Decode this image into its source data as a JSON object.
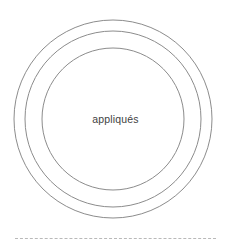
{
  "figure": {
    "background_color": "#ffffff",
    "width": 231,
    "height": 251,
    "center_label": "appliqués",
    "label_color": "#3f3f3f",
    "ring_color": "#8c8c8c",
    "divider_color": "#b9b9b9",
    "divider_style": "dashed"
  },
  "chart_data": {
    "type": "diagram",
    "title": "appliqués",
    "shape": "concentric-circles",
    "center": {
      "x": 113,
      "y": 119
    },
    "rings": [
      {
        "name": "outer-ring",
        "radius": 99,
        "stroke": "#8c8c8c",
        "stroke_width": 1,
        "fill": "none"
      },
      {
        "name": "middle-ring",
        "radius": 88,
        "stroke": "#8c8c8c",
        "stroke_width": 1,
        "fill": "none"
      },
      {
        "name": "inner-ring",
        "radius": 71,
        "stroke": "#8c8c8c",
        "stroke_width": 1,
        "fill": "none"
      }
    ],
    "annotations": [
      {
        "text": "appliqués",
        "x": 115,
        "y": 120,
        "align": "center"
      }
    ],
    "divider": {
      "y": 238,
      "x_start": 15,
      "x_end": 216,
      "style": "dashed",
      "color": "#b9b9b9"
    },
    "grid": false,
    "legend": null
  }
}
